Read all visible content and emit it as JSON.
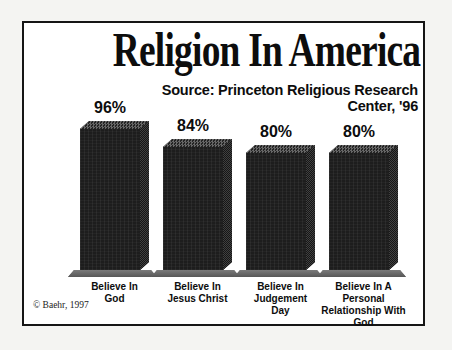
{
  "page": {
    "copyright": "© Baehr, 1997"
  },
  "chart_data": {
    "type": "bar",
    "title": "Religion In America",
    "source": "Source: Princeton Religious Research\nCenter, '96",
    "categories": [
      "Believe In\nGod",
      "Believe In\nJesus Christ",
      "Believe In\nJudgement\nDay",
      "Believe In A\nPersonal\nRelationship With\nGod"
    ],
    "values": [
      96,
      84,
      80,
      80
    ],
    "value_labels": [
      "96%",
      "84%",
      "80%",
      "80%"
    ],
    "ylabel": "",
    "xlabel": "",
    "ylim": [
      0,
      100
    ],
    "grid": false,
    "legend": false,
    "style": "3d-column",
    "colors": {
      "bar_front": "#1d1d1d",
      "bar_top": "#4a4a4a",
      "bar_side": "#262626",
      "platform": "#6a6a6a",
      "frame_border": "#151515",
      "background": "#ffffff",
      "text": "#0d0d0d"
    }
  }
}
